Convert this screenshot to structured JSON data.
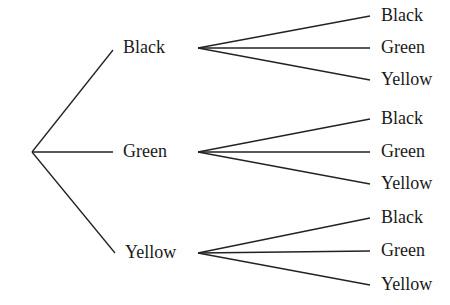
{
  "diagram": {
    "type": "tree",
    "root": {
      "x": 32,
      "y": 152
    },
    "level1": [
      {
        "label": "Black",
        "x": 123,
        "y": 48,
        "end": [
          113,
          50
        ],
        "start": [
          198,
          48
        ],
        "children": [
          {
            "label": "Black",
            "y": 16
          },
          {
            "label": "Green",
            "y": 48
          },
          {
            "label": "Yellow",
            "y": 80
          }
        ]
      },
      {
        "label": "Green",
        "x": 123,
        "y": 152,
        "end": [
          113,
          152
        ],
        "start": [
          198,
          152
        ],
        "children": [
          {
            "label": "Black",
            "y": 119
          },
          {
            "label": "Green",
            "y": 152
          },
          {
            "label": "Yellow",
            "y": 184
          }
        ]
      },
      {
        "label": "Yellow",
        "x": 125,
        "y": 253,
        "end": [
          115,
          253
        ],
        "start": [
          198,
          253
        ],
        "children": [
          {
            "label": "Black",
            "y": 218
          },
          {
            "label": "Green",
            "y": 251
          },
          {
            "label": "Yellow",
            "y": 285
          }
        ]
      }
    ],
    "child_line_end_x": 370,
    "child_label_x": 381
  }
}
